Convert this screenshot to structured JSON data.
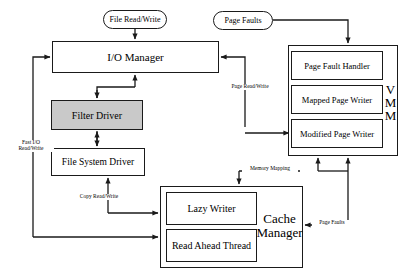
{
  "diagram": {
    "type": "block-diagram",
    "nodes": [
      {
        "id": "file-read-write",
        "label": "File Read/Write",
        "shape": "pill",
        "x": 103,
        "y": 10,
        "w": 64,
        "h": 19,
        "fill": "#ffffff"
      },
      {
        "id": "page-faults-top",
        "label": "Page Faults",
        "shape": "pill",
        "x": 213,
        "y": 11,
        "w": 60,
        "h": 19,
        "fill": "#ffffff"
      },
      {
        "id": "io-manager",
        "label": "I/O Manager",
        "shape": "rect",
        "x": 52,
        "y": 41,
        "w": 167,
        "h": 32,
        "fill": "#ffffff"
      },
      {
        "id": "filter-driver",
        "label": "Filter Driver",
        "shape": "rect",
        "x": 51,
        "y": 100,
        "w": 92,
        "h": 30,
        "fill": "#c9c9c9"
      },
      {
        "id": "file-system-driver",
        "label": "File System Driver",
        "shape": "rect",
        "x": 51,
        "y": 148,
        "w": 94,
        "h": 28,
        "fill": "#ffffff"
      },
      {
        "id": "vmm-outer",
        "label": "",
        "shape": "rect",
        "x": 288,
        "y": 45,
        "w": 110,
        "h": 111,
        "fill": "#ffffff"
      },
      {
        "id": "page-fault-handler",
        "label": "Page Fault Handler",
        "shape": "rect",
        "x": 291,
        "y": 51,
        "w": 92,
        "h": 29,
        "fill": "#ffffff"
      },
      {
        "id": "mapped-page-writer",
        "label": "Mapped Page Writer",
        "shape": "rect",
        "x": 291,
        "y": 85,
        "w": 92,
        "h": 29,
        "fill": "#ffffff"
      },
      {
        "id": "modified-page-writer",
        "label": "Modified Page Writer",
        "shape": "rect",
        "x": 291,
        "y": 119,
        "w": 92,
        "h": 29,
        "fill": "#ffffff"
      },
      {
        "id": "cache-manager-outer",
        "label": "",
        "shape": "rect",
        "x": 160,
        "y": 186,
        "w": 143,
        "h": 82,
        "fill": "#ffffff"
      },
      {
        "id": "lazy-writer",
        "label": "Lazy Writer",
        "shape": "rect",
        "x": 166,
        "y": 192,
        "w": 91,
        "h": 33,
        "fill": "#ffffff"
      },
      {
        "id": "read-ahead-thread",
        "label": "Read Ahead Thread",
        "shape": "rect",
        "x": 166,
        "y": 229,
        "w": 91,
        "h": 33,
        "fill": "#ffffff"
      }
    ],
    "group_labels": [
      {
        "id": "vmm-label",
        "lines": [
          "V",
          "M",
          "M"
        ],
        "x": 383,
        "y": 78,
        "w": 15,
        "h": 52,
        "font_size": 13
      },
      {
        "id": "cache-label",
        "lines": [
          "Cache",
          "Manager"
        ],
        "x": 255,
        "y": 205,
        "w": 48,
        "h": 42,
        "font_size": 13
      }
    ],
    "edge_labels": [
      {
        "id": "page-read-write",
        "lines": [
          "Page Read/Write"
        ],
        "x": 224,
        "y": 85,
        "w": 52,
        "h": 10,
        "font_size": 5.5
      },
      {
        "id": "fast-io",
        "lines": [
          "Fast I/O",
          "Read/Write"
        ],
        "x": 9,
        "y": 141,
        "w": 44,
        "h": 18,
        "font_size": 5.5
      },
      {
        "id": "memory-mapping",
        "lines": [
          "Memory Mapping"
        ],
        "x": 244,
        "y": 166,
        "w": 52,
        "h": 10,
        "font_size": 5.5
      },
      {
        "id": "copy-read-write",
        "lines": [
          "Copy Read/Write"
        ],
        "x": 73,
        "y": 195,
        "w": 52,
        "h": 10,
        "font_size": 5.5
      },
      {
        "id": "page-faults-cache",
        "lines": [
          "Page Faults"
        ],
        "x": 314,
        "y": 239,
        "w": 38,
        "h": 10,
        "font_size": 5.5
      }
    ],
    "colors": {
      "stroke": "#1a1a1a",
      "shaded_fill": "#c9c9c9",
      "background": "#ffffff",
      "text": "#000000"
    }
  }
}
